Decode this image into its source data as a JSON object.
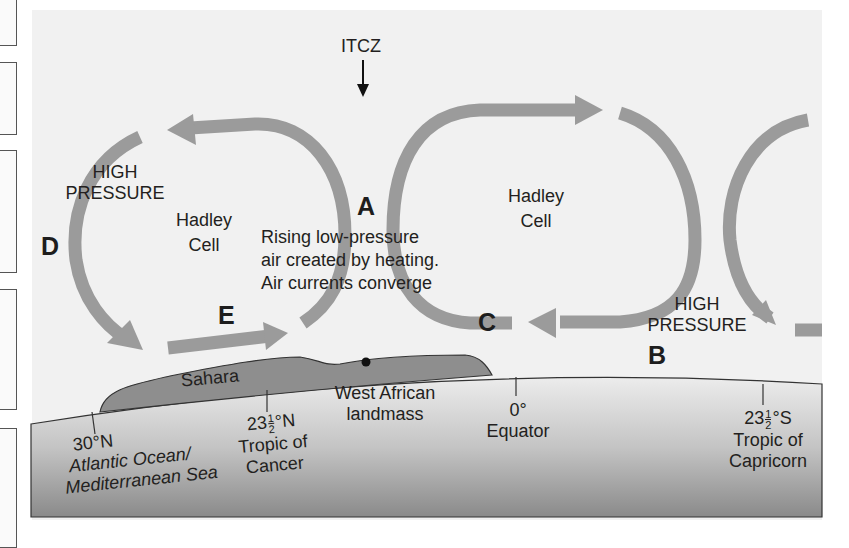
{
  "diagram": {
    "title_marker": {
      "label": "ITCZ",
      "arrow": "down-arrow"
    },
    "cells": [
      {
        "label_line1": "Hadley",
        "label_line2": "Cell"
      },
      {
        "label_line1": "Hadley",
        "label_line2": "Cell"
      }
    ],
    "pressure_labels": [
      {
        "line1": "HIGH",
        "line2": "PRESSURE"
      },
      {
        "line1": "HIGH",
        "line2": "PRESSURE"
      }
    ],
    "letters": {
      "A": "A",
      "B": "B",
      "C": "C",
      "D": "D",
      "E": "E"
    },
    "itcz_note": {
      "line1": "Rising low-pressure",
      "line2": "air created by heating.",
      "line3": "Air currents converge"
    },
    "landmarks": {
      "sahara": "Sahara",
      "west_african_line1": "West African",
      "west_african_line2": "landmass"
    },
    "latitudes": [
      {
        "value": "30°N",
        "line2": "Atlantic Ocean/",
        "line3": "Mediterranean Sea"
      },
      {
        "whole": "23",
        "num": "1",
        "den": "2",
        "suffix": "°N",
        "line2": "Tropic of",
        "line3": "Cancer"
      },
      {
        "value": "0°",
        "line2": "Equator"
      },
      {
        "whole": "23",
        "num": "1",
        "den": "2",
        "suffix": "°S",
        "line2": "Tropic of",
        "line3": "Capricorn"
      }
    ],
    "colors": {
      "arrow": "#9b9b9b",
      "panel": "#f1f1f1",
      "land": "#8c8c8c",
      "surface_top": "#e6e6e6",
      "surface_bottom": "#8f8f8f",
      "text": "#231f20"
    }
  }
}
